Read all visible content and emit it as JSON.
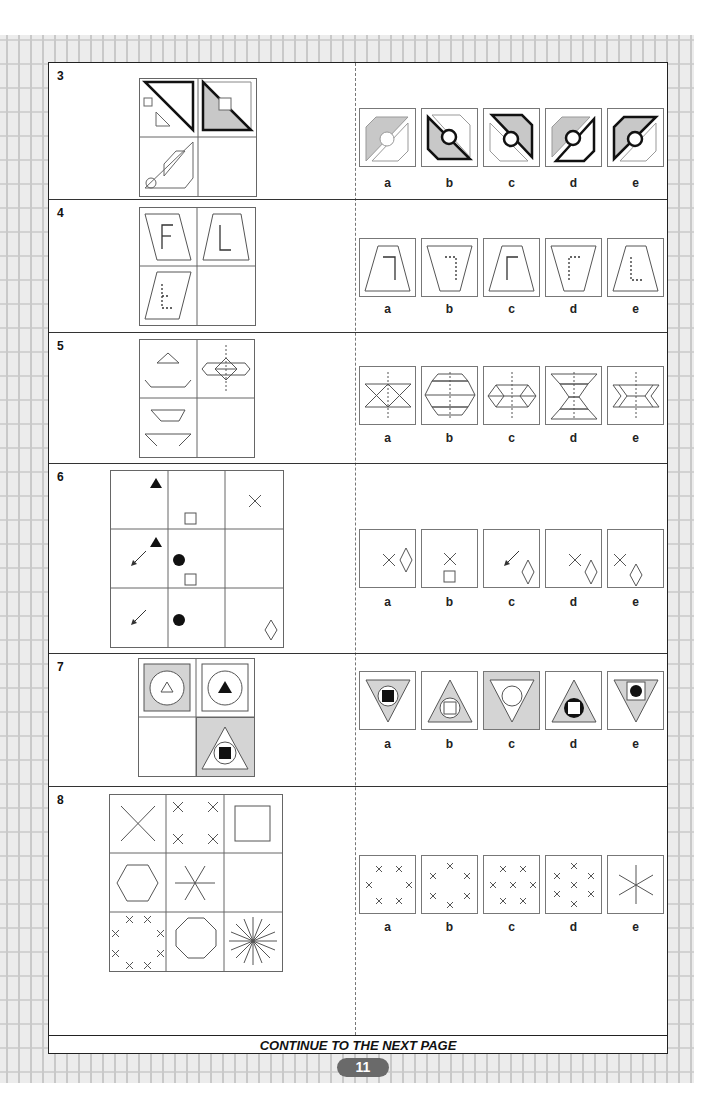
{
  "page": {
    "page_number": "11",
    "footer_text": "CONTINUE TO THE NEXT PAGE"
  },
  "option_labels": [
    "a",
    "b",
    "c",
    "d",
    "e"
  ],
  "questions": [
    {
      "number": "3",
      "type": "2x2 matrix",
      "description": "Triangles with squares/circles; missing bottom-right",
      "options": [
        "a",
        "b",
        "c",
        "d",
        "e"
      ]
    },
    {
      "number": "4",
      "type": "2x2 matrix",
      "description": "Trapezoids with letters F and L; missing bottom-right",
      "options": [
        "a",
        "b",
        "c",
        "d",
        "e"
      ]
    },
    {
      "number": "5",
      "type": "2x2 matrix",
      "description": "Trapezoid shapes combined along dotted axis; missing bottom-right",
      "options": [
        "a",
        "b",
        "c",
        "d",
        "e"
      ]
    },
    {
      "number": "6",
      "type": "3x3 matrix",
      "description": "Symbols (triangle, square, cross, arrow, circle, diamond) in grid; missing center-right",
      "options": [
        "a",
        "b",
        "c",
        "d",
        "e"
      ]
    },
    {
      "number": "7",
      "type": "2x2 matrix",
      "description": "Nested shapes with shading; missing bottom-left",
      "options": [
        "a",
        "b",
        "c",
        "d",
        "e"
      ]
    },
    {
      "number": "8",
      "type": "3x3 matrix",
      "description": "Crosses, polygons and star lines by count; missing center-right",
      "options": [
        "a",
        "b",
        "c",
        "d",
        "e"
      ]
    }
  ],
  "colors": {
    "shade": "#c8c8c8",
    "line": "#444444",
    "badge": "#6a6a6a"
  }
}
